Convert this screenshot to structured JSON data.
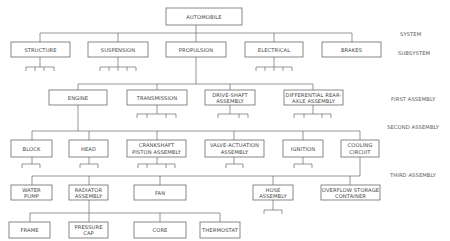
{
  "levels": {
    "system": "SYSTEM",
    "subsystem": "SUBSYSTEM",
    "first": "FIRST ASSEMBLY",
    "second": "SECOND ASSEMBLY",
    "third": "THIRD ASSEMBLY"
  },
  "nodes": {
    "automobile": [
      "AUTOMOBILE"
    ],
    "structure": [
      "STRUCTURE"
    ],
    "suspension": [
      "SUSPENSION"
    ],
    "propulsion": [
      "PROPULSION"
    ],
    "electrical": [
      "ELECTRICAL"
    ],
    "brakes": [
      "BRAKES"
    ],
    "engine": [
      "ENGINE"
    ],
    "transmission": [
      "TRANSMISSION"
    ],
    "driveshaft": [
      "DRIVE-SHAFT",
      "ASSEMBLY"
    ],
    "differential": [
      "DIFFERENTIAL REAR-",
      "AXLE ASSEMBLY"
    ],
    "block": [
      "BLOCK"
    ],
    "head": [
      "HEAD"
    ],
    "crankshaft": [
      "CRANKSHAFT",
      "PISTON ASSEMBLY"
    ],
    "valve": [
      "VALVE-ACTUATION",
      "ASSEMBLY"
    ],
    "ignition": [
      "IGNITION"
    ],
    "cooling": [
      "COOLING",
      "CIRCUIT"
    ],
    "waterpump": [
      "WATER",
      "PUMP"
    ],
    "radiator": [
      "RADIATOR",
      "ASSEMBLY"
    ],
    "fan": [
      "FAN"
    ],
    "hose": [
      "HOSE",
      "ASSEMBLY"
    ],
    "overflow": [
      "OVERFLOW STORAGE",
      "CONTAINER"
    ],
    "frame": [
      "FRAME"
    ],
    "pressurecap": [
      "PRESSURE",
      "CAP"
    ],
    "core": [
      "CORE"
    ],
    "thermostat": [
      "THERMOSTAT"
    ]
  }
}
